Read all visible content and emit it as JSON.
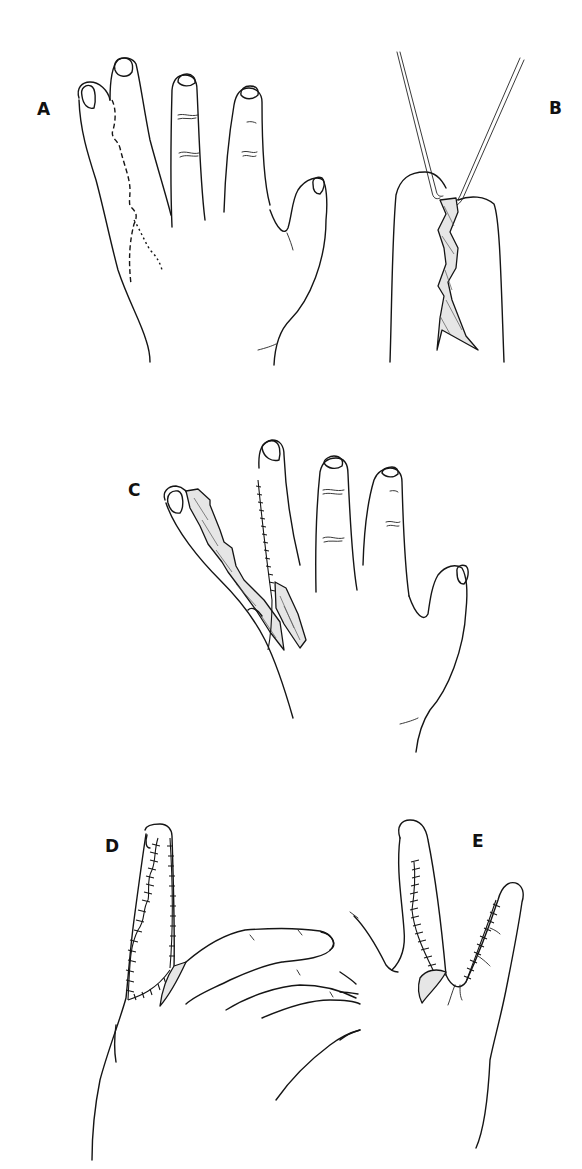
{
  "figure": {
    "panels": [
      {
        "id": "A",
        "label": "A",
        "content": "Dorsal hand with syndactyly of ring and small fingers; dashed zig-zag incision lines marked"
      },
      {
        "id": "B",
        "label": "B",
        "content": "Separated fingers held apart by retractors with interdigitating zig-zag flaps"
      },
      {
        "id": "C",
        "label": "C",
        "content": "Hand after separation showing raised flaps and partial suture line"
      },
      {
        "id": "D",
        "label": "D",
        "content": "Lateral view of finger with zig-zag sutured flaps and commissure graft"
      },
      {
        "id": "E",
        "label": "E",
        "content": "Palmar view with sutured flaps on both fingers and web-space graft"
      }
    ],
    "colors": {
      "ink": "#151515",
      "background": "#ffffff",
      "graft_fill": "#e6e6e6"
    }
  }
}
